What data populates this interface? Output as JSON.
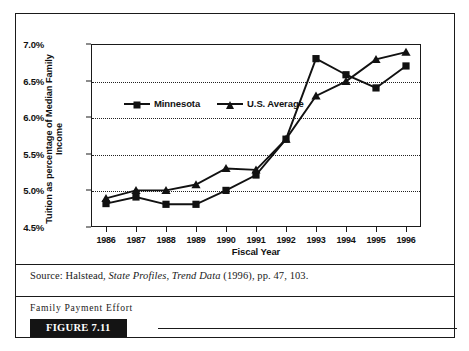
{
  "figure": {
    "badge_label": "FIGURE 7.11",
    "caption": "Family Payment Effort",
    "source_prefix": "Source: Halstead,",
    "source_italic": "State Profiles, Trend Data",
    "source_suffix": "(1996), pp. 47, 103."
  },
  "chart_data": {
    "type": "line",
    "title": "",
    "xlabel": "Fiscal Year",
    "ylabel": "Tuition as percentage of Median Family Income",
    "categories": [
      "1986",
      "1987",
      "1988",
      "1989",
      "1990",
      "1991",
      "1992",
      "1993",
      "1994",
      "1995",
      "1996"
    ],
    "ylim": [
      4.5,
      7.0
    ],
    "ytick_values": [
      4.5,
      5.0,
      5.5,
      6.0,
      6.5,
      7.0
    ],
    "ytick_labels": [
      "4.5%",
      "5.0%",
      "5.5%",
      "6.0%",
      "6.5%",
      "7.0%"
    ],
    "grid": true,
    "grid_axis": "y",
    "grid_style": "dotted",
    "legend_position": "inside-upper-left",
    "series": [
      {
        "name": "Minnesota",
        "marker": "square",
        "color": "#111111",
        "values": [
          4.82,
          4.91,
          4.81,
          4.81,
          5.0,
          5.21,
          5.7,
          6.8,
          6.58,
          6.4,
          6.7
        ]
      },
      {
        "name": "U.S. Average",
        "marker": "triangle",
        "color": "#111111",
        "values": [
          4.89,
          5.0,
          5.0,
          5.08,
          5.3,
          5.28,
          5.7,
          6.29,
          6.49,
          6.79,
          6.89
        ]
      }
    ]
  }
}
